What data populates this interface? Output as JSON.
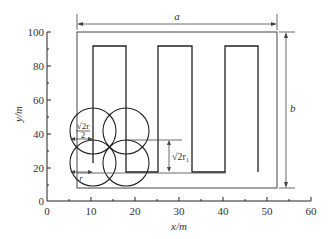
{
  "figure": {
    "type": "coverage-path-diagram",
    "xaxis": {
      "label": "x/m",
      "ticks": [
        "0",
        "10",
        "20",
        "30",
        "40",
        "50",
        "60"
      ],
      "range": [
        0,
        60
      ]
    },
    "yaxis": {
      "label": "y/m",
      "ticks": [
        "0",
        "20",
        "40",
        "60",
        "80",
        "100"
      ],
      "range": [
        0,
        100
      ]
    },
    "dimensions": {
      "width_label": "a",
      "height_label": "b"
    },
    "annotations": {
      "half_diagonal": "√2r",
      "half_diagonal_denominator": "2",
      "radius": "r",
      "spacing": "√2r₁"
    },
    "boundary_rect": {
      "x0": 7,
      "x1": 53,
      "y0": 8,
      "y1": 98
    },
    "serpentine_path_points": [
      [
        11,
        18
      ],
      [
        11,
        90
      ],
      [
        18.5,
        90
      ],
      [
        18.5,
        18
      ],
      [
        26,
        18
      ],
      [
        26,
        90
      ],
      [
        33,
        90
      ],
      [
        33,
        18
      ],
      [
        40.5,
        18
      ],
      [
        40.5,
        90
      ],
      [
        48,
        90
      ],
      [
        48,
        18
      ]
    ],
    "circles": [
      {
        "cx": 11,
        "cy": 18,
        "r": 5
      },
      {
        "cx": 18.5,
        "cy": 18,
        "r": 5
      },
      {
        "cx": 11,
        "cy": 38,
        "r": 5
      },
      {
        "cx": 18.5,
        "cy": 38,
        "r": 5
      }
    ]
  }
}
